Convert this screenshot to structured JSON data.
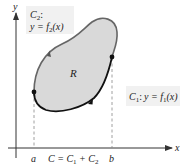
{
  "figure": {
    "axes": {
      "x_label": "x",
      "y_label": "y"
    },
    "region_label": "R",
    "curve_upper": {
      "name": "C",
      "name_sub": "2",
      "eq_lhs": "y = f",
      "eq_sub": "2",
      "eq_rhs": "(x)",
      "colon": ":"
    },
    "curve_lower": {
      "name": "C",
      "name_sub": "1",
      "colon": ":",
      "eq_lhs": "y = f",
      "eq_sub": "1",
      "eq_rhs": "(x)"
    },
    "bottom_labels": {
      "a": "a",
      "b": "b",
      "c_eq": "C = C",
      "c1_sub": "1",
      "plus": " + C",
      "c2_sub": "2"
    },
    "colors": {
      "region_fill": "#d9d9d9",
      "curve_upper": "#666666",
      "curve_lower": "#111111",
      "axis": "#333333",
      "label_box": "#f1f1f1"
    }
  }
}
